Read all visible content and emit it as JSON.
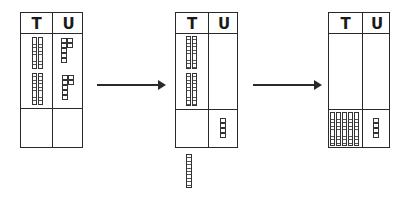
{
  "diagram": {
    "column_headers": {
      "tens": "T",
      "units": "U"
    },
    "panels": [
      {
        "id": "left",
        "top_row": {
          "tens": 4,
          "units": 14
        },
        "bottom_row": {
          "tens": 0,
          "units": 0
        }
      },
      {
        "id": "middle",
        "top_row": {
          "tens": 4,
          "units": 0
        },
        "bottom_row": {
          "tens": 0,
          "units": 4
        },
        "removed_outside": {
          "tens": 1
        }
      },
      {
        "id": "right",
        "top_row": {
          "tens": 0,
          "units": 0
        },
        "bottom_row": {
          "tens": 5,
          "units": 4
        }
      }
    ],
    "arrows": 2,
    "colors": {
      "ink": "#2a2a2a",
      "background": "#ffffff"
    }
  }
}
